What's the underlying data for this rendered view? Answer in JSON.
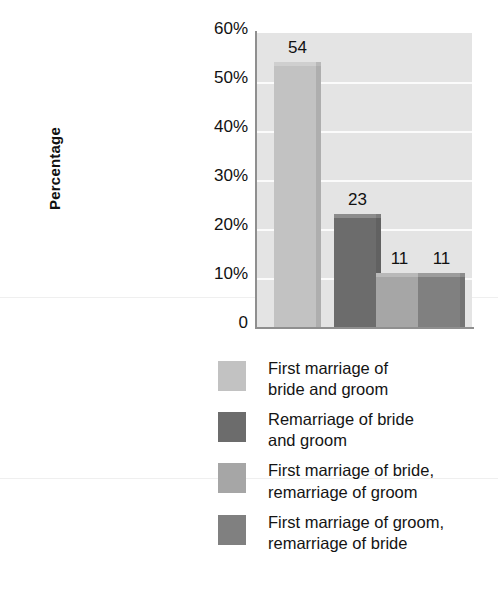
{
  "chart_data": {
    "type": "bar",
    "title": "",
    "xlabel": "",
    "ylabel": "Percentage",
    "ylim": [
      0,
      60
    ],
    "grid": true,
    "legend_position": "below",
    "categories": [
      "First marriage of bride and groom",
      "Remarriage of bride and groom",
      "First marriage of bride, remarriage of groom",
      "First marriage of groom, remarriage of bride"
    ],
    "values": [
      54,
      23,
      11,
      11
    ],
    "data_labels": [
      "54",
      "23",
      "11",
      "11"
    ],
    "colors": [
      "#c2c2c2",
      "#6c6c6c",
      "#a6a6a6",
      "#808080"
    ],
    "y_ticks": [
      {
        "value": 60,
        "label": "60%"
      },
      {
        "value": 50,
        "label": "50%"
      },
      {
        "value": 40,
        "label": "40%"
      },
      {
        "value": 30,
        "label": "30%"
      },
      {
        "value": 20,
        "label": "20%"
      },
      {
        "value": 10,
        "label": "10%"
      },
      {
        "value": 0,
        "label": "0"
      }
    ],
    "plot_background": "#e4e4e4",
    "gridline_color": "#fbfbfb",
    "axis_color": "#8f8f8f"
  },
  "axis": {
    "y_title": "Percentage",
    "tick_60": "60%",
    "tick_50": "50%",
    "tick_40": "40%",
    "tick_30": "30%",
    "tick_20": "20%",
    "tick_10": "10%",
    "tick_0": "0"
  },
  "bars": [
    {
      "label": "54",
      "value": 54,
      "color": "#c2c2c2"
    },
    {
      "label": "23",
      "value": 23,
      "color": "#6c6c6c"
    },
    {
      "label": "11",
      "value": 11,
      "color": "#a6a6a6"
    },
    {
      "label": "11",
      "value": 11,
      "color": "#808080"
    }
  ],
  "legend": {
    "items": [
      {
        "text": "First marriage of\nbride and groom",
        "color": "#c2c2c2"
      },
      {
        "text": "Remarriage of bride\nand groom",
        "color": "#6c6c6c"
      },
      {
        "text": "First marriage of bride,\nremarriage of groom",
        "color": "#a6a6a6"
      },
      {
        "text": "First marriage of groom,\nremarriage of bride",
        "color": "#808080"
      }
    ]
  }
}
